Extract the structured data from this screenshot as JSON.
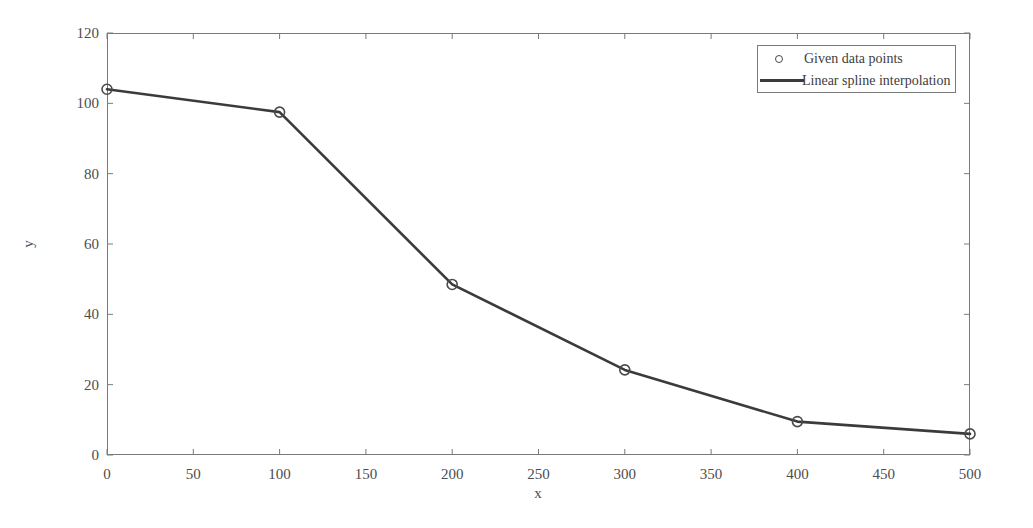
{
  "chart_data": {
    "type": "line",
    "title": "",
    "subtitle": "",
    "xlabel": "x",
    "ylabel": "y",
    "xlim": [
      0,
      500
    ],
    "ylim": [
      0,
      120
    ],
    "xticks": [
      0,
      50,
      100,
      150,
      200,
      250,
      300,
      350,
      400,
      450,
      500
    ],
    "yticks": [
      0,
      20,
      40,
      60,
      80,
      100,
      120
    ],
    "xtick_labels": [
      "0",
      "50",
      "100",
      "150",
      "200",
      "250",
      "300",
      "350",
      "400",
      "450",
      "500"
    ],
    "ytick_labels": [
      "0",
      "20",
      "40",
      "60",
      "80",
      "100",
      "120"
    ],
    "grid": false,
    "legend_position": "top-right",
    "x": [
      0,
      100,
      200,
      300,
      400,
      500
    ],
    "series": [
      {
        "name": "Linear spline interpolation",
        "style": "line",
        "color": "#3b3b3b",
        "values": [
          104,
          97.5,
          48.5,
          24.2,
          9.5,
          6
        ]
      },
      {
        "name": "Given data points",
        "style": "marker",
        "marker": "circle-open",
        "color": "#4a4a4a",
        "values": [
          104,
          97.5,
          48.5,
          24.2,
          9.5,
          6
        ]
      }
    ],
    "legend": [
      {
        "label": "Given data points",
        "marker": "circle-open"
      },
      {
        "label": "Linear spline interpolation",
        "marker": "line"
      }
    ]
  },
  "axes": {
    "x_title": "x",
    "y_title": "y"
  },
  "legend": {
    "points_label": "Given data points",
    "line_label": "Linear spline interpolation"
  },
  "colors": {
    "line": "#3b3b3b",
    "marker": "#4a4a4a",
    "axis": "#7a7a7a",
    "text": "#4d4d4d",
    "background": "#ffffff"
  }
}
